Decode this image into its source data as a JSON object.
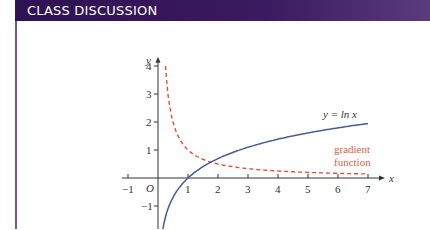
{
  "header": {
    "title": "CLASS DISCUSSION"
  },
  "colors": {
    "header_bg": "#2e1253",
    "ln_curve": "#4a5a92",
    "gradient_curve": "#e0503a",
    "label_red": "#d9604a"
  },
  "chart_data": {
    "type": "line",
    "title": "",
    "xlabel": "x",
    "ylabel": "y",
    "origin_label": "O",
    "xlim": [
      -1.2,
      7.3
    ],
    "ylim": [
      -1.8,
      4.4
    ],
    "x_ticks": [
      -1,
      1,
      2,
      3,
      4,
      5,
      6,
      7
    ],
    "y_ticks": [
      -1,
      1,
      2,
      3,
      4
    ],
    "grid": false,
    "series": [
      {
        "name": "y = ln x",
        "style": "solid",
        "color": "#4a5a92",
        "function": "ln(x)",
        "domain": [
          0.16,
          7
        ]
      },
      {
        "name": "gradient function",
        "style": "dashed",
        "color": "#e0503a",
        "function": "1/x",
        "domain": [
          0.25,
          7
        ]
      }
    ],
    "annotations": [
      {
        "text": "y = ln x",
        "x": 7,
        "y": 2.1
      },
      {
        "text": "gradient",
        "x": 6.6,
        "y": 0.9
      },
      {
        "text": "function",
        "x": 6.6,
        "y": 0.55
      }
    ]
  },
  "labels": {
    "ln_label": "y = ln x",
    "grad_label_1": "gradient",
    "grad_label_2": "function",
    "x_var": "x",
    "y_var": "y",
    "origin": "O"
  }
}
